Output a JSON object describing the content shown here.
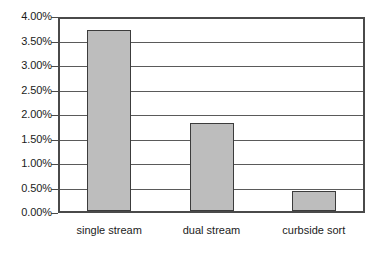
{
  "chart_data": {
    "type": "bar",
    "title": "",
    "subtitle": "",
    "xlabel": "",
    "ylabel": "",
    "categories": [
      "single stream",
      "dual stream",
      "curbside sort"
    ],
    "values": [
      3.7,
      1.8,
      0.4
    ],
    "value_unit": "%",
    "ylim": [
      0,
      4
    ],
    "ytick_step": 0.5,
    "ytick_labels": [
      "4.00%",
      "3.50%",
      "3.00%",
      "2.50%",
      "2.00%",
      "1.50%",
      "1.00%",
      "0.50%",
      "0.00%"
    ],
    "ytick_values": [
      4.0,
      3.5,
      3.0,
      2.5,
      2.0,
      1.5,
      1.0,
      0.5,
      0.0
    ],
    "grid": true,
    "legend": false,
    "legend_position": "none",
    "series": [
      {
        "name": "",
        "values": [
          3.7,
          1.8,
          0.4
        ]
      }
    ],
    "colors": {
      "bar_fill": "#bdbdbd",
      "bar_stroke": "#3c3c3c",
      "gridline": "#5a5a5a",
      "axis": "#4a4a4a",
      "text": "#1b1b1b",
      "background": "#ffffff"
    }
  }
}
